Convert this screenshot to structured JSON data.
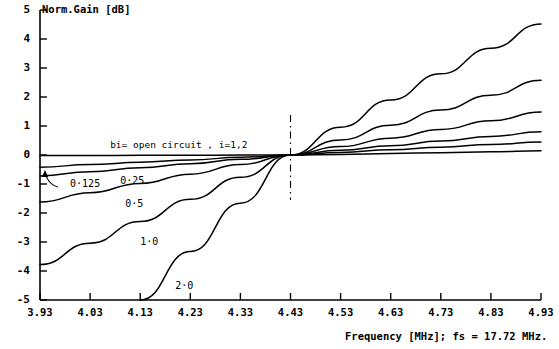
{
  "chart_data": {
    "type": "line",
    "title": "Norm.Gain [dB]",
    "xlabel": "Frequency [MHz]; fs = 17.72 MHz.",
    "ylabel": "Norm.Gain [dB]",
    "xlim": [
      3.93,
      4.93
    ],
    "ylim": [
      -5,
      5
    ],
    "grid": false,
    "legend_position": "inline-annotations",
    "xticks": [
      "3.93",
      "4.03",
      "4.13",
      "4.23",
      "4.33",
      "4.43",
      "4.53",
      "4.63",
      "4.73",
      "4.83",
      "4.93"
    ],
    "xtick_values": [
      3.93,
      4.03,
      4.13,
      4.23,
      4.33,
      4.43,
      4.53,
      4.63,
      4.73,
      4.83,
      4.93
    ],
    "yticks": [
      "5",
      "4",
      "3",
      "2",
      "1",
      "0",
      "-1",
      "-2",
      "-3",
      "-4",
      "-5"
    ],
    "ytick_values": [
      5,
      4,
      3,
      2,
      1,
      0,
      -1,
      -2,
      -3,
      -4,
      -5
    ],
    "annotations": [
      {
        "text": "bi= open circuit , i=1,2",
        "x": 4.07,
        "y": 0.32
      },
      {
        "text": "0·125",
        "x": 3.99,
        "y": -1.02
      },
      {
        "text": "0·25",
        "x": 4.09,
        "y": -0.92
      },
      {
        "text": "0·5",
        "x": 4.1,
        "y": -1.72
      },
      {
        "text": "1·0",
        "x": 4.13,
        "y": -3.05
      },
      {
        "text": "2·0",
        "x": 4.2,
        "y": -4.55
      }
    ],
    "crossover_marker": {
      "x": 4.43,
      "y": 0,
      "style": "dash-dot vertical line"
    },
    "series": [
      {
        "name": "open circuit",
        "label": "bi= open circuit , i=1,2",
        "x": [
          3.93,
          4.03,
          4.13,
          4.23,
          4.33,
          4.43,
          4.53,
          4.63,
          4.73,
          4.83,
          4.93
        ],
        "values": [
          -0.02,
          -0.02,
          -0.01,
          -0.01,
          0.0,
          0.0,
          0.02,
          0.05,
          0.08,
          0.11,
          0.15
        ]
      },
      {
        "name": "0·125",
        "label": "0·125",
        "x": [
          3.93,
          4.03,
          4.13,
          4.23,
          4.33,
          4.43,
          4.53,
          4.63,
          4.73,
          4.83,
          4.93
        ],
        "values": [
          -0.42,
          -0.33,
          -0.25,
          -0.17,
          -0.08,
          0.0,
          0.09,
          0.18,
          0.27,
          0.36,
          0.45
        ]
      },
      {
        "name": "0·25",
        "label": "0·25",
        "x": [
          3.93,
          4.03,
          4.13,
          4.23,
          4.33,
          4.43,
          4.53,
          4.63,
          4.73,
          4.83,
          4.93
        ],
        "values": [
          -0.72,
          -0.58,
          -0.44,
          -0.3,
          -0.15,
          0.0,
          0.16,
          0.32,
          0.48,
          0.64,
          0.8
        ]
      },
      {
        "name": "0·5",
        "label": "0·5",
        "x": [
          3.93,
          4.03,
          4.13,
          4.23,
          4.33,
          4.43,
          4.53,
          4.63,
          4.73,
          4.83,
          4.93
        ],
        "values": [
          -1.62,
          -1.3,
          -0.98,
          -0.66,
          -0.33,
          0.0,
          0.29,
          0.58,
          0.88,
          1.18,
          1.48
        ]
      },
      {
        "name": "1·0",
        "label": "1·0",
        "x": [
          3.93,
          4.03,
          4.13,
          4.23,
          4.33,
          4.43,
          4.53,
          4.63,
          4.73,
          4.83,
          4.93
        ],
        "values": [
          -3.78,
          -3.04,
          -2.29,
          -1.53,
          -0.77,
          0.0,
          0.52,
          1.03,
          1.55,
          2.06,
          2.58
        ]
      },
      {
        "name": "2·0",
        "label": "2·0",
        "x": [
          4.13,
          4.23,
          4.33,
          4.43,
          4.53,
          4.63,
          4.73,
          4.83,
          4.93
        ],
        "values": [
          -5.0,
          -3.33,
          -1.66,
          0.0,
          0.96,
          1.9,
          2.8,
          3.68,
          4.52
        ]
      }
    ]
  },
  "axis": {
    "y_title": "Norm.Gain [dB]",
    "x_title": "Frequency [MHz]; fs = 17.72 MHz."
  },
  "colors": {
    "line": "#000000",
    "background": "#ffffff",
    "axis": "#000000"
  }
}
